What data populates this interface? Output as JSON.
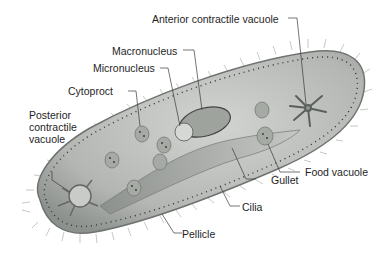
{
  "diagram": {
    "colors": {
      "background": "#ffffff",
      "body_fill": "#b9bcb8",
      "body_edge": "#6f736f",
      "leader_line": "#3a3a3a",
      "label_text": "#1e1e1e"
    },
    "labels": {
      "anterior_contractile_vacuole": "Anterior contractile vacuole",
      "macronucleus": "Macronucleus",
      "micronucleus": "Micronucleus",
      "cytoproct": "Cytoproct",
      "posterior_contractile_vacuole": "Posterior contractile vacuole",
      "food_vacuole": "Food vacuole",
      "gullet": "Gullet",
      "cilia": "Cilia",
      "pellicle": "Pellicle"
    }
  }
}
